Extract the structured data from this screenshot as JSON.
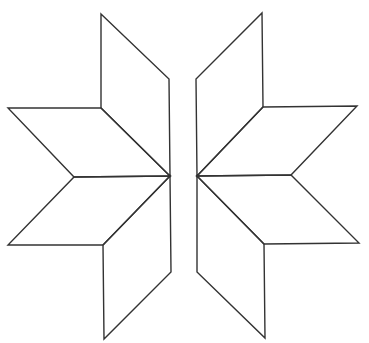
{
  "figure": {
    "width": 369,
    "height": 343,
    "stroke_color": "#333333",
    "background": "#ffffff",
    "halves": [
      {
        "name": "left-half",
        "rhombuses": [
          {
            "name": "left-top-vertical-rhombus",
            "points": "101,14 169,79 170,176 101,108"
          },
          {
            "name": "left-top-horizontal-rhombus",
            "points": "8,108 101,108 170,176 74,177"
          },
          {
            "name": "left-bottom-horizontal-rhombus",
            "points": "74,177 170,176 103,245 8,245"
          },
          {
            "name": "left-bottom-vertical-rhombus",
            "points": "170,176 171,272 104,339 103,245"
          }
        ]
      },
      {
        "name": "right-half",
        "rhombuses": [
          {
            "name": "right-top-vertical-rhombus",
            "points": "262,13 263,107 197,176 196,79"
          },
          {
            "name": "right-top-horizontal-rhombus",
            "points": "263,107 357,106 291,175 197,176"
          },
          {
            "name": "right-bottom-horizontal-rhombus",
            "points": "197,176 291,175 359,243 264,244"
          },
          {
            "name": "right-bottom-vertical-rhombus",
            "points": "197,176 264,244 265,338 197,272"
          }
        ]
      }
    ]
  }
}
